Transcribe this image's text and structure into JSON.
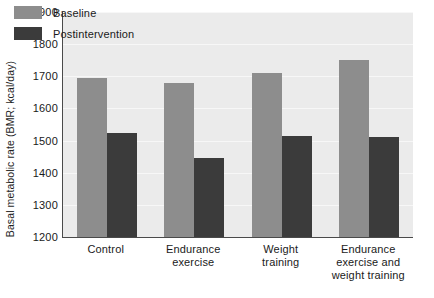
{
  "chart_data": {
    "type": "bar",
    "title": "",
    "subtitle": "",
    "xlabel": "",
    "ylabel": "Basal metabolic rate (BMR; kcal/day)",
    "ylim": [
      1200,
      1900
    ],
    "ytick_step": 100,
    "yticks": [
      1900,
      1800,
      1700,
      1600,
      1500,
      1400,
      1300,
      1200
    ],
    "ytick_labels": [
      "1900",
      "1800",
      "1700",
      "1600",
      "1500",
      "1400",
      "1300",
      "1200"
    ],
    "grid": true,
    "grid_axis": "y",
    "legend_position": "top-left-inside",
    "categories": [
      "Control",
      "Endurance exercise",
      "Weight training",
      "Endurance exercise and weight training"
    ],
    "category_label_lines": [
      [
        "Control"
      ],
      [
        "Endurance",
        "exercise"
      ],
      [
        "Weight",
        "training"
      ],
      [
        "Endurance",
        "exercise and",
        "weight training"
      ]
    ],
    "series": [
      {
        "name": "Baseline",
        "color": "#8d8d8d",
        "values": [
          1695,
          1680,
          1710,
          1750
        ]
      },
      {
        "name": "Postintervention",
        "color": "#3b3b3b",
        "values": [
          1525,
          1445,
          1515,
          1510
        ]
      }
    ],
    "colors": {
      "baseline": "#8d8d8d",
      "postintervention": "#3b3b3b",
      "plot_background": "#ebebeb",
      "gridline": "#f7f7f7",
      "axis": "#4a4a4a",
      "text": "#1a1a1a",
      "page_background": "#ffffff"
    }
  },
  "legend": {
    "items": [
      {
        "label": "Baseline",
        "swatch": "baseline"
      },
      {
        "label": "Postintervention",
        "swatch": "post"
      }
    ]
  }
}
